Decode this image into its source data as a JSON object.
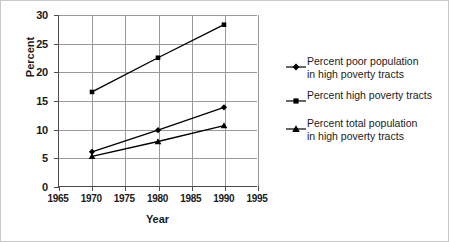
{
  "chart_data": {
    "type": "line",
    "title": "",
    "xlabel": "Year",
    "ylabel": "Percent",
    "x": [
      1970,
      1980,
      1990
    ],
    "xlim": [
      1965,
      1995
    ],
    "ylim": [
      0,
      30
    ],
    "xticks": [
      1965,
      1970,
      1975,
      1980,
      1985,
      1990,
      1995
    ],
    "yticks": [
      0,
      5,
      10,
      15,
      20,
      25,
      30
    ],
    "grid": true,
    "legend_position": "right",
    "series": [
      {
        "name": "Percent poor population\nin high poverty tracts",
        "marker": "diamond",
        "color": "#000000",
        "values": [
          6.0,
          9.8,
          13.8
        ]
      },
      {
        "name": "Percent high poverty tracts",
        "marker": "square",
        "color": "#000000",
        "values": [
          16.5,
          22.5,
          28.3
        ]
      },
      {
        "name": "Percent total population\nin high poverty tracts",
        "marker": "triangle",
        "color": "#000000",
        "values": [
          5.2,
          7.8,
          10.6
        ]
      }
    ]
  }
}
